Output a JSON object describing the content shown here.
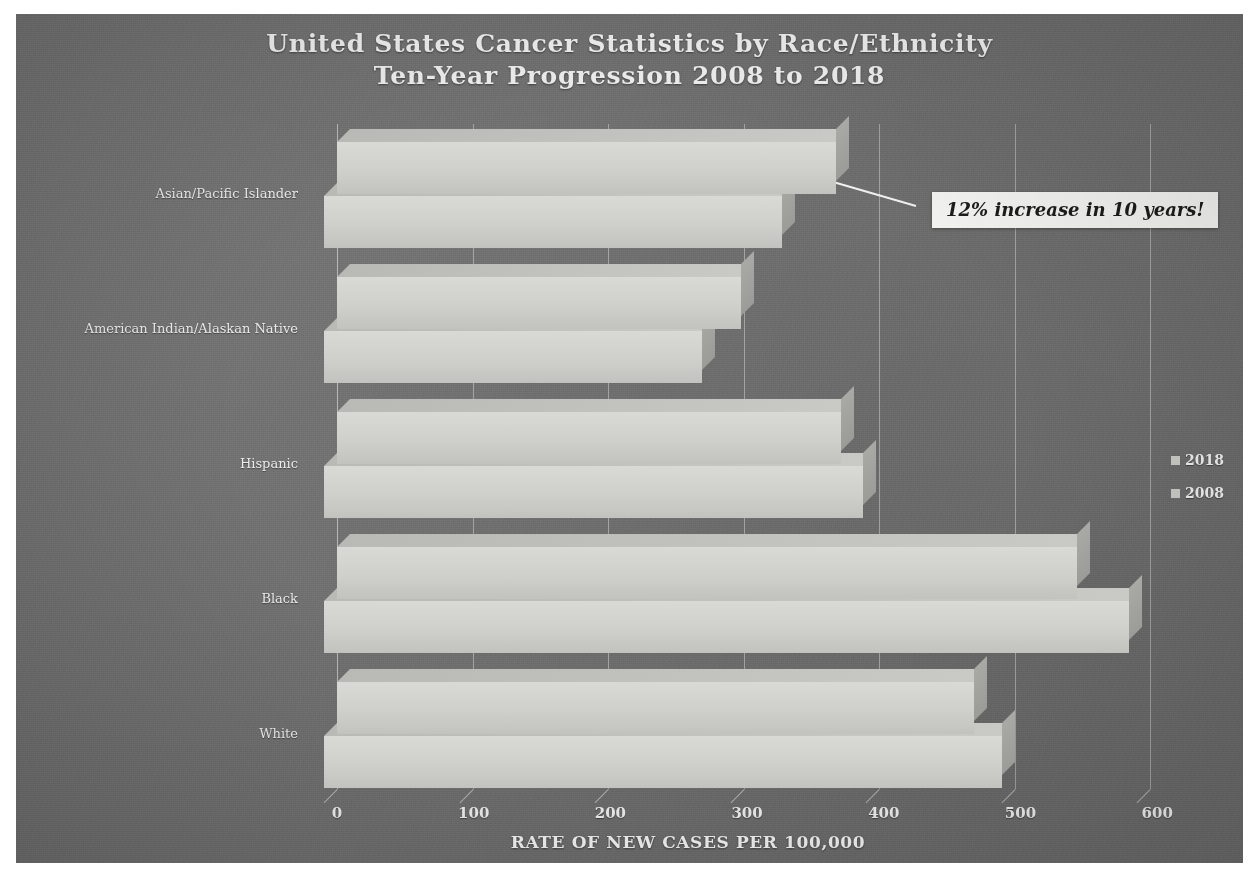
{
  "title": {
    "line1": "United States Cancer Statistics by Race/Ethnicity",
    "line2": "Ten-Year Progression 2008 to 2018"
  },
  "annotation": {
    "text": "12% increase in 10 years!"
  },
  "legend": {
    "position": "right",
    "items": [
      {
        "label": "2018",
        "color": "#c9c9c5"
      },
      {
        "label": "2008",
        "color": "#c9c9c5"
      }
    ]
  },
  "axis": {
    "x_title": "RATE OF NEW CASES PER 100,000",
    "x_ticks": [
      "0",
      "100",
      "200",
      "300",
      "400",
      "500",
      "600"
    ]
  },
  "chart_data": {
    "type": "bar",
    "orientation": "horizontal",
    "title": "United States Cancer Statistics by Race/Ethnicity Ten-Year Progression 2008 to 2018",
    "xlabel": "RATE OF NEW CASES PER 100,000",
    "ylabel": "",
    "xlim": [
      0,
      650
    ],
    "xticks": [
      0,
      100,
      200,
      300,
      400,
      500,
      600
    ],
    "grid": true,
    "legend_position": "right",
    "categories": [
      "Asian/Pacific Islander",
      "American Indian/Alaskan Native",
      "Hispanic",
      "Black",
      "White"
    ],
    "series": [
      {
        "name": "2018",
        "values": [
          368,
          298,
          372,
          546,
          470
        ]
      },
      {
        "name": "2008",
        "values": [
          338,
          279,
          398,
          594,
          500
        ]
      }
    ],
    "annotations": [
      {
        "text": "12% increase in 10 years!",
        "points_to_category": "Asian/Pacific Islander",
        "points_to_series": "2018"
      }
    ]
  },
  "colors": {
    "panel_background": "#6e6e6e",
    "bar_face": "#cfcfcb",
    "bar_top": "#c1c1bd",
    "bar_side": "#a3a39f",
    "text": "#efefef",
    "gridline": "#ebebeb",
    "callout_background": "#f2f2f0",
    "callout_text": "#1b1b1b"
  }
}
